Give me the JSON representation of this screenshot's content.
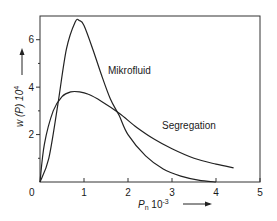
{
  "chart_data": {
    "type": "line",
    "title": "",
    "xlabel": "P_n 10^-3",
    "ylabel": "w(P) 10^4",
    "xlim": [
      0,
      5
    ],
    "ylim": [
      0,
      7
    ],
    "xticks": [
      "0",
      "1",
      "2",
      "3",
      "4",
      "5"
    ],
    "yticks": [
      "2",
      "4",
      "6"
    ],
    "grid": false,
    "legend": "inline labels",
    "series": [
      {
        "name": "Mikrofluid",
        "x": [
          0,
          0.2,
          0.4,
          0.6,
          0.8,
          0.9,
          1.0,
          1.2,
          1.4,
          1.6,
          1.8,
          2.0,
          2.4,
          2.8,
          3.2,
          3.6,
          4.0
        ],
        "y": [
          0,
          1.0,
          3.2,
          5.6,
          6.75,
          6.8,
          6.6,
          5.6,
          4.5,
          3.5,
          2.8,
          2.0,
          1.1,
          0.55,
          0.25,
          0.08,
          0.0
        ]
      },
      {
        "name": "Segregation",
        "x": [
          0,
          0.1,
          0.3,
          0.5,
          0.7,
          0.9,
          1.1,
          1.4,
          1.8,
          2.2,
          2.6,
          3.0,
          3.5,
          4.0,
          4.4
        ],
        "y": [
          0,
          1.6,
          3.0,
          3.6,
          3.8,
          3.8,
          3.7,
          3.4,
          2.9,
          2.3,
          1.8,
          1.4,
          1.0,
          0.75,
          0.6
        ]
      }
    ]
  },
  "labels": {
    "series_1": "Mikrofluid",
    "series_2": "Segregation",
    "x_axis_main": "P",
    "x_axis_sub": "n",
    "x_axis_rest": " 10",
    "x_axis_exp": "-3",
    "y_axis_main": "w (P) 10",
    "y_axis_exp": "4",
    "origin": "0"
  }
}
